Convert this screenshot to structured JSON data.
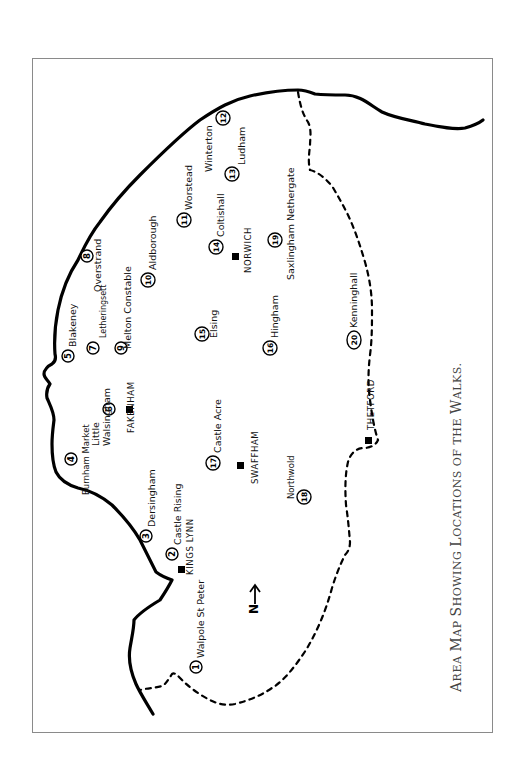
{
  "caption": {
    "words": [
      {
        "cap": "A",
        "rest": "REA"
      },
      {
        "cap": "M",
        "rest": "AP"
      },
      {
        "cap": "S",
        "rest": "HOWING"
      },
      {
        "cap": "L",
        "rest": "OCATIONS"
      },
      {
        "cap": "",
        "rest": "OF"
      },
      {
        "cap": "",
        "rest": "THE"
      },
      {
        "cap": "W",
        "rest": "ALKS."
      }
    ],
    "full_text": "Area Map Showing Locations of the Walks."
  },
  "north_arrow": {
    "label": "N"
  },
  "walks": [
    {
      "number": "1",
      "name": "Walpole St Peter"
    },
    {
      "number": "2",
      "name": "Castle Rising"
    },
    {
      "number": "3",
      "name": "Dersingham"
    },
    {
      "number": "4",
      "name": "Burnham Market"
    },
    {
      "number": "5",
      "name": "Blakeney"
    },
    {
      "number": "6",
      "name_line1": "Little",
      "name_line2": "Walsingham"
    },
    {
      "number": "7",
      "name": "Letheringsett"
    },
    {
      "number": "8",
      "name": "Overstrand"
    },
    {
      "number": "9",
      "name": "Melton Constable"
    },
    {
      "number": "10",
      "name": "Aldborough"
    },
    {
      "number": "11",
      "name": "Worstead"
    },
    {
      "number": "12",
      "name": "Winterton"
    },
    {
      "number": "13",
      "name": "Ludham"
    },
    {
      "number": "14",
      "name": "Coltishall"
    },
    {
      "number": "15",
      "name": "Elsing"
    },
    {
      "number": "16",
      "name": "Hingham"
    },
    {
      "number": "17",
      "name": "Castle Acre"
    },
    {
      "number": "18",
      "name": "Northwold"
    },
    {
      "number": "19",
      "name": "Saxlingham Nethergate"
    },
    {
      "number": "20",
      "name": "Kenninghall"
    }
  ],
  "towns": [
    {
      "name": "KINGS LYNN"
    },
    {
      "name": "FAKENHAM"
    },
    {
      "name": "NORWICH"
    },
    {
      "name": "SWAFFHAM"
    },
    {
      "name": "THETFORD"
    }
  ]
}
